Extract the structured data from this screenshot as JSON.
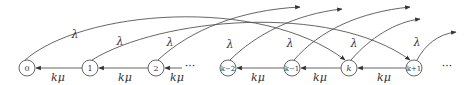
{
  "diagram": {
    "type": "state-transition",
    "nodes": [
      {
        "id": "0",
        "label": "0",
        "x": 27
      },
      {
        "id": "1",
        "label": "1",
        "x": 90
      },
      {
        "id": "2",
        "label": "2",
        "x": 156
      },
      {
        "id": "k-2",
        "label": "k−2",
        "x": 228
      },
      {
        "id": "k-1",
        "label": "k−1",
        "x": 292
      },
      {
        "id": "k",
        "label": "k",
        "x": 349
      },
      {
        "id": "k+1",
        "label": "k+1",
        "x": 414
      }
    ],
    "ellipsis": [
      {
        "label": "···",
        "x": 190
      },
      {
        "label": "···",
        "x": 447
      }
    ],
    "backward_edges": [
      {
        "from": "1",
        "to": "0",
        "label": "kμ"
      },
      {
        "from": "2",
        "to": "1",
        "label": "kμ"
      },
      {
        "from": "…",
        "to": "2",
        "label": "kμ"
      },
      {
        "from": "k-1",
        "to": "k-2",
        "label": "kμ"
      },
      {
        "from": "k",
        "to": "k-1",
        "label": "kμ"
      },
      {
        "from": "k+1",
        "to": "k",
        "label": "kμ"
      }
    ],
    "forward_arcs": [
      {
        "from": "0",
        "to": "k",
        "label": "λ"
      },
      {
        "from": "1",
        "to": "k+1",
        "label": "λ"
      },
      {
        "from": "2",
        "to": "off",
        "label": "λ"
      },
      {
        "from": "k-2",
        "to": "off",
        "label": "λ"
      },
      {
        "from": "k-1",
        "to": "off",
        "label": "λ"
      },
      {
        "from": "k",
        "to": "off",
        "label": "λ"
      },
      {
        "from": "k+1",
        "to": "off",
        "label": "λ"
      }
    ],
    "colors": {
      "stroke": "#555555",
      "text": "#333333",
      "background": "#ffffff"
    }
  }
}
